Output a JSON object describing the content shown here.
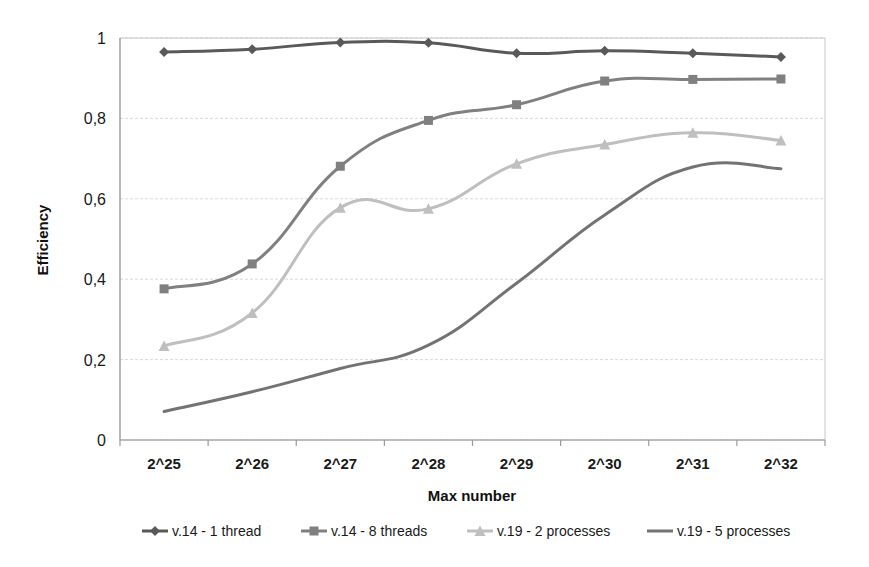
{
  "chart_data": {
    "type": "line",
    "title": "",
    "xlabel": "Max number",
    "ylabel": "Efficiency",
    "categories": [
      "2^25",
      "2^26",
      "2^27",
      "2^28",
      "2^29",
      "2^30",
      "2^31",
      "2^32"
    ],
    "ylim": [
      0,
      1
    ],
    "yticks": [
      0,
      0.2,
      0.4,
      0.6,
      0.8,
      1
    ],
    "ytick_labels": [
      "0",
      "0,2",
      "0,4",
      "0,6",
      "0,8",
      "1"
    ],
    "grid": true,
    "legend_position": "bottom",
    "series": [
      {
        "name": "v.14 - 1 thread",
        "marker": "diamond",
        "color": "#595959",
        "values": [
          0.965,
          0.972,
          0.989,
          0.988,
          0.962,
          0.968,
          0.962,
          0.953
        ]
      },
      {
        "name": "v.14 - 8 threads",
        "marker": "square",
        "color": "#808080",
        "values": [
          0.376,
          0.438,
          0.681,
          0.795,
          0.834,
          0.893,
          0.897,
          0.898
        ]
      },
      {
        "name": "v.19 - 2 processes",
        "marker": "triangle",
        "color": "#bfbfbf",
        "values": [
          0.234,
          0.316,
          0.578,
          0.575,
          0.687,
          0.735,
          0.764,
          0.745
        ]
      },
      {
        "name": "v.19 - 5 processes",
        "marker": "none",
        "color": "#737373",
        "values": [
          0.071,
          0.12,
          0.178,
          0.236,
          0.39,
          0.56,
          0.679,
          0.675
        ]
      }
    ]
  },
  "colors": {
    "gridline": "#d9d9d9",
    "axis": "#9a9a9a",
    "text": "#1a1a1a",
    "background": "#ffffff"
  }
}
